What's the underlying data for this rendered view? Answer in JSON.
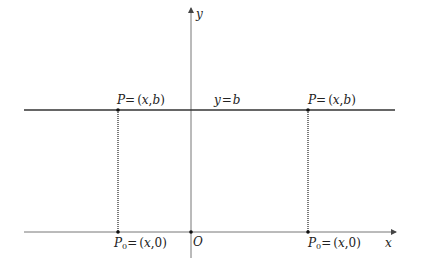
{
  "diagram": {
    "axes": {
      "x_label": "x",
      "y_label": "y",
      "origin_label": "O"
    },
    "line": {
      "label": "y = b",
      "label_parts": [
        "y",
        "=",
        "b"
      ]
    },
    "points": [
      {
        "name": "P-left",
        "upper_label": "P = (x, b)",
        "upper_parts": [
          "P",
          "=",
          "(",
          "x",
          ",",
          "b",
          ")"
        ],
        "lower_label": "P0 = (x, 0)",
        "lower_parts": [
          "P",
          "0",
          "=",
          "(",
          "x",
          ",",
          "0",
          ")"
        ]
      },
      {
        "name": "P-right",
        "upper_label": "P = (x, b)",
        "upper_parts": [
          "P",
          "=",
          "(",
          "x",
          ",",
          "b",
          ")"
        ],
        "lower_label": "P0 = (x, 0)",
        "lower_parts": [
          "P",
          "0",
          "=",
          "(",
          "x",
          ",",
          "0",
          ")"
        ]
      }
    ],
    "colors": {
      "axis": "#666666",
      "line": "#333333",
      "dotted": "#222222",
      "text": "#222222"
    }
  }
}
